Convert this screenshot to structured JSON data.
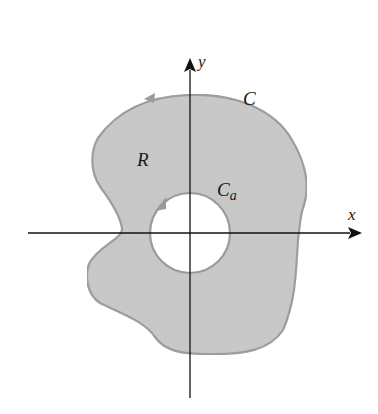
{
  "figure": {
    "axes": {
      "x_label": "x",
      "y_label": "y"
    },
    "labels": {
      "outer_curve": "C",
      "region": "R",
      "inner_curve_main": "C",
      "inner_curve_sub": "a"
    },
    "colors": {
      "region_fill": "#c9c9c9",
      "boundary_stroke": "#9a9a9a",
      "axis": "#111111",
      "hole": "#ffffff"
    }
  }
}
